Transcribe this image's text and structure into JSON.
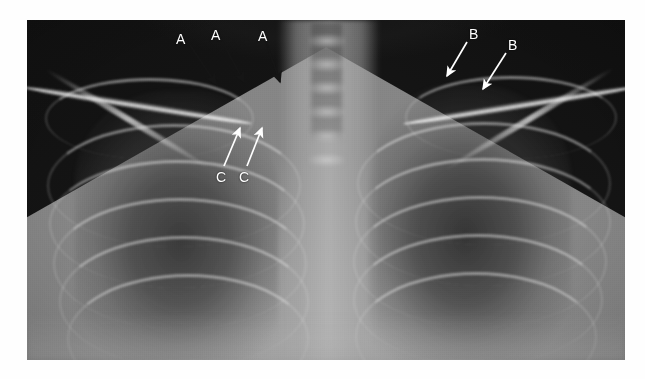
{
  "figure": {
    "kind": "chest-radiograph",
    "modality_label": "",
    "canvas": {
      "width": 645,
      "height": 379
    },
    "plate": {
      "x": 27,
      "y": 20,
      "width": 598,
      "height": 340
    },
    "background_color": "#ffffff"
  },
  "annotations": {
    "colors": {
      "dark_arrow": "#151515",
      "light_arrow": "#ffffff",
      "label_dark": "#ffffff",
      "label_light": "#ffffff"
    },
    "markers": [
      {
        "id": "a1",
        "label": "A",
        "style": "dark",
        "label_x": 176,
        "label_y": 32,
        "x1": 190,
        "y1": 45,
        "x2": 216,
        "y2": 84
      },
      {
        "id": "a2",
        "label": "A",
        "style": "dark",
        "label_x": 211,
        "label_y": 28,
        "x1": 222,
        "y1": 41,
        "x2": 244,
        "y2": 82
      },
      {
        "id": "a3",
        "label": "A",
        "style": "dark",
        "label_x": 258,
        "label_y": 29,
        "x1": 266,
        "y1": 42,
        "x2": 280,
        "y2": 82
      },
      {
        "id": "b1",
        "label": "B",
        "style": "light",
        "label_x": 469,
        "label_y": 27,
        "x1": 467,
        "y1": 42,
        "x2": 447,
        "y2": 76
      },
      {
        "id": "b2",
        "label": "B",
        "style": "light",
        "label_x": 508,
        "label_y": 38,
        "x1": 506,
        "y1": 53,
        "x2": 483,
        "y2": 89
      },
      {
        "id": "c1",
        "label": "C",
        "style": "light",
        "label_x": 216,
        "label_y": 170,
        "x1": 224,
        "y1": 166,
        "x2": 240,
        "y2": 128
      },
      {
        "id": "c2",
        "label": "C",
        "style": "light",
        "label_x": 239,
        "label_y": 170,
        "x1": 247,
        "y1": 166,
        "x2": 262,
        "y2": 128
      }
    ]
  },
  "anatomy": {
    "vertebrae_tops_pct": [
      4,
      11,
      18,
      25,
      32,
      39
    ],
    "clavicles": [
      {
        "id": "clavicle-left",
        "x": -4,
        "y": 82,
        "w": 230,
        "h": 7,
        "rot": 9
      },
      {
        "id": "clavicle-right",
        "x": 375,
        "y": 82,
        "w": 235,
        "h": 7,
        "rot": -9
      }
    ],
    "first_ribs": [
      {
        "id": "rib1-left",
        "x": 18,
        "y": 58,
        "w": 205,
        "h": 78,
        "rot": 0
      },
      {
        "id": "rib1-right",
        "x": 378,
        "y": 56,
        "w": 208,
        "h": 80,
        "rot": 0
      }
    ],
    "scapulae": [
      {
        "id": "scapula-left",
        "x": 6,
        "y": 96,
        "w": 190,
        "h": 6,
        "rot": 31
      },
      {
        "id": "scapula-right",
        "x": 405,
        "y": 96,
        "w": 195,
        "h": 6,
        "rot": -31
      }
    ],
    "posterior_ribs_left": [
      {
        "x": 20,
        "y": 104,
        "w": 250,
        "h": 120,
        "rot": 0
      },
      {
        "x": 22,
        "y": 140,
        "w": 252,
        "h": 125,
        "rot": 0
      },
      {
        "x": 26,
        "y": 178,
        "w": 250,
        "h": 128,
        "rot": 0
      },
      {
        "x": 32,
        "y": 216,
        "w": 246,
        "h": 128,
        "rot": 0
      },
      {
        "x": 40,
        "y": 254,
        "w": 238,
        "h": 126,
        "rot": 0
      }
    ],
    "posterior_ribs_right": [
      {
        "x": 330,
        "y": 102,
        "w": 250,
        "h": 120,
        "rot": 0
      },
      {
        "x": 328,
        "y": 138,
        "w": 252,
        "h": 125,
        "rot": 0
      },
      {
        "x": 326,
        "y": 176,
        "w": 250,
        "h": 128,
        "rot": 0
      },
      {
        "x": 326,
        "y": 214,
        "w": 246,
        "h": 128,
        "rot": 0
      },
      {
        "x": 328,
        "y": 252,
        "w": 238,
        "h": 126,
        "rot": 0
      }
    ]
  }
}
